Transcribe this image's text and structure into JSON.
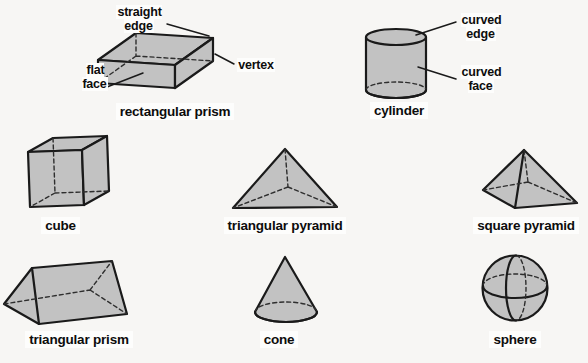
{
  "figure": {
    "background": "#f7f6f4",
    "shape_fill": "#c2c2c2",
    "outline_color": "#1a1a1a",
    "text_color": "#0d0d0d"
  },
  "annotations": {
    "straight_edge": "straight edge",
    "vertex": "vertex",
    "flat_face": "flat face",
    "curved_edge": "curved edge",
    "curved_face": "curved face"
  },
  "shapes": [
    {
      "id": "rectangular-prism",
      "caption": "rectangular prism"
    },
    {
      "id": "cylinder",
      "caption": "cylinder"
    },
    {
      "id": "cube",
      "caption": "cube"
    },
    {
      "id": "triangular-pyramid",
      "caption": "triangular pyramid"
    },
    {
      "id": "square-pyramid",
      "caption": "square pyramid"
    },
    {
      "id": "triangular-prism",
      "caption": "triangular prism"
    },
    {
      "id": "cone",
      "caption": "cone"
    },
    {
      "id": "sphere",
      "caption": "sphere"
    }
  ]
}
